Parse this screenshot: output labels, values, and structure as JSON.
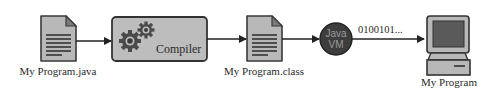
{
  "diagram": {
    "nodes": [
      {
        "id": "source-file",
        "icon": "document-icon",
        "label": "My Program.java"
      },
      {
        "id": "compiler",
        "icon": "gears-icon",
        "label": "Compiler"
      },
      {
        "id": "class-file",
        "icon": "document-icon",
        "label": "My Program.class"
      },
      {
        "id": "jvm",
        "icon": "circle",
        "label_line1": "Java",
        "label_line2": "VM"
      },
      {
        "id": "program",
        "icon": "computer-icon",
        "label": "My Program"
      }
    ],
    "edges": [
      {
        "from": "source-file",
        "to": "compiler",
        "label": ""
      },
      {
        "from": "compiler",
        "to": "class-file",
        "label": ""
      },
      {
        "from": "class-file",
        "to": "jvm",
        "label": ""
      },
      {
        "from": "jvm",
        "to": "program",
        "label": "0100101..."
      }
    ],
    "colors": {
      "icon_fill": "#b8b8b8",
      "icon_stroke": "#3a3a3a",
      "jvm_fill": "#3d3d3d",
      "screen_fill": "#5a5a5a",
      "line": "#222222"
    }
  }
}
